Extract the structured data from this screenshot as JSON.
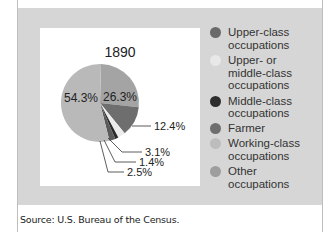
{
  "chart_data": {
    "type": "pie",
    "title": "1890",
    "slices": [
      {
        "label": "Other occupations",
        "value": 26.3,
        "color": "#a4a4a4",
        "display": "26.3%"
      },
      {
        "label": "Farmer",
        "value": 12.4,
        "color": "#6e6e6e",
        "display": "12.4%"
      },
      {
        "label": "Upper- or middle-class occupations",
        "value": 3.1,
        "color": "#ececec",
        "display": "3.1%"
      },
      {
        "label": "Middle-class occupations",
        "value": 1.4,
        "color": "#2a2a2a",
        "display": "1.4%"
      },
      {
        "label": "Upper-class occupations",
        "value": 2.5,
        "color": "#5a5a5a",
        "display": "2.5%"
      },
      {
        "label": "Working-class occupations",
        "value": 54.3,
        "color": "#b9b9b9",
        "display": "54.3%"
      }
    ],
    "legend": [
      {
        "label": "Upper-class occupations",
        "color": "#6a6a6a"
      },
      {
        "label": "Upper- or middle-class occupations",
        "color": "#e8e8e8"
      },
      {
        "label": "Middle-class occupations",
        "color": "#2e2e2e"
      },
      {
        "label": "Farmer",
        "color": "#6e6e6e"
      },
      {
        "label": "Working-class occupations",
        "color": "#bdbdbd"
      },
      {
        "label": "Other occupations",
        "color": "#9e9e9e"
      }
    ],
    "legend_position": "right"
  },
  "legend": {
    "items": [
      {
        "line1": "Upper-class",
        "line2": "occupations",
        "line3": ""
      },
      {
        "line1": "Upper- or",
        "line2": "middle-class",
        "line3": "occupations"
      },
      {
        "line1": "Middle-class",
        "line2": "occupations",
        "line3": ""
      },
      {
        "line1": "Farmer",
        "line2": "",
        "line3": ""
      },
      {
        "line1": "Working-class",
        "line2": "occupations",
        "line3": ""
      },
      {
        "line1": "Other",
        "line2": "occupations",
        "line3": ""
      }
    ]
  },
  "labels": {
    "l_543": "54.3%",
    "l_263": "26.3%",
    "l_124": "12.4%",
    "l_31": "3.1%",
    "l_14": "1.4%",
    "l_25": "2.5%"
  },
  "source": "Source: U.S. Bureau of the Census."
}
